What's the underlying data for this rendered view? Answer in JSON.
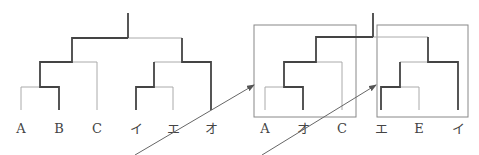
{
  "colors": {
    "thick": "#444444",
    "thin": "#aaaaaa",
    "box": "#888888",
    "arrow": "#666666",
    "label": "#444444"
  },
  "trees": [
    {
      "name": "original-tree",
      "leaves": [
        "A",
        "B",
        "C",
        "イ",
        "エ",
        "オ"
      ]
    },
    {
      "name": "rearranged-left-subtree",
      "leaves": [
        "A",
        "オ",
        "C"
      ]
    },
    {
      "name": "rearranged-right-subtree",
      "leaves": [
        "エ",
        "E",
        "イ"
      ]
    }
  ],
  "arrows": [
    {
      "name": "arrow-to-left-box",
      "target": "rearranged-left-subtree"
    },
    {
      "name": "arrow-to-right-box",
      "target": "rearranged-right-subtree"
    }
  ]
}
